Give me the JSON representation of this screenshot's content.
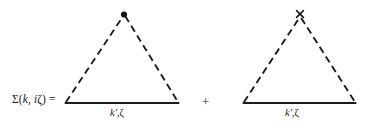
{
  "figure": {
    "type": "feynman-diagram-equation",
    "background_color": "#ffffff",
    "ink_color": "#1c1c1c",
    "width": 377,
    "height": 131,
    "lhs": {
      "text": "Σ(k, iζ) =",
      "sigma": "Σ",
      "open_paren": "(",
      "momentum": "k",
      "comma": ", ",
      "imaginary_unit": "i",
      "frequency": "ζ",
      "close_paren": ")",
      "equals": "="
    },
    "operator": {
      "plus": "+"
    },
    "diagrams": [
      {
        "id": "diagram-1",
        "vertex_marker": "filled-dot",
        "leg_label": "k', ζ",
        "leg_label_momentum": "k'",
        "leg_label_frequency": "ζ",
        "apex": {
          "x": 124,
          "y": 14
        },
        "base_left": {
          "x": 65,
          "y": 103
        },
        "base_right": {
          "x": 179,
          "y": 103
        },
        "side_style": "dashed",
        "base_style": "solid"
      },
      {
        "id": "diagram-2",
        "vertex_marker": "cross",
        "leg_label": "k', ζ",
        "leg_label_momentum": "k'",
        "leg_label_frequency": "ζ",
        "apex": {
          "x": 300,
          "y": 14
        },
        "base_left": {
          "x": 243,
          "y": 103
        },
        "base_right": {
          "x": 356,
          "y": 103
        },
        "side_style": "dashed",
        "base_style": "solid"
      }
    ]
  }
}
